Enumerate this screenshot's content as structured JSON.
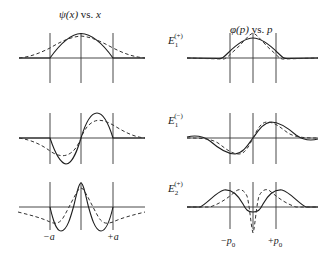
{
  "titles": {
    "left": {
      "func": "ψ(x)",
      "sep": " vs. ",
      "var": "x"
    },
    "right": {
      "func": "φ(p)",
      "sep": " vs. ",
      "var": "p"
    }
  },
  "rows": [
    {
      "energy_symbol": "E",
      "energy_sub": "1",
      "energy_sup": "(+)"
    },
    {
      "energy_symbol": "E",
      "energy_sub": "1",
      "energy_sup": "(−)"
    },
    {
      "energy_symbol": "E",
      "energy_sub": "2",
      "energy_sup": "(+)"
    }
  ],
  "ticks": {
    "left": {
      "neg": "−a",
      "pos": "+a"
    },
    "right": {
      "neg_sign": "−",
      "neg_var": "p",
      "neg_sub": "0",
      "pos_sign": "+",
      "pos_var": "p",
      "pos_sub": "0"
    }
  },
  "legend_implied": {
    "solid": "exact wavefunction",
    "dashed": "approximation"
  },
  "colors": {
    "stroke": "#1e1e1e",
    "background": "#ffffff"
  }
}
